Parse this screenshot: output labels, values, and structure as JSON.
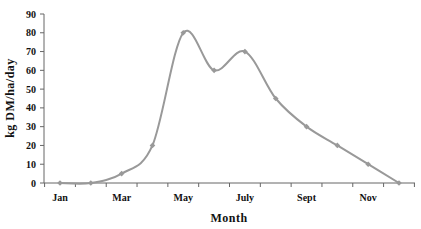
{
  "chart_data": {
    "type": "line",
    "title": "",
    "xlabel": "Month",
    "ylabel": "kg DM/ha/day",
    "x_tick_labels": [
      "Jan",
      "Mar",
      "May",
      "July",
      "Sept",
      "Nov"
    ],
    "y_ticks": [
      0,
      10,
      20,
      30,
      40,
      50,
      60,
      70,
      80,
      90
    ],
    "ylim": [
      0,
      90
    ],
    "grid": false,
    "legend": null,
    "categories": [
      "Jan",
      "Feb",
      "Mar",
      "Apr",
      "May",
      "Jun",
      "Jul",
      "Aug",
      "Sep",
      "Oct",
      "Nov",
      "Dec"
    ],
    "series": [
      {
        "name": "Pasture growth rate",
        "values": [
          0,
          0,
          5,
          20,
          80,
          60,
          70,
          45,
          30,
          20,
          10,
          0
        ],
        "color": "#999999",
        "smooth": true,
        "markers": true
      }
    ]
  },
  "axes": {
    "x_title": "Month",
    "y_title": "kg DM/ha/day"
  }
}
